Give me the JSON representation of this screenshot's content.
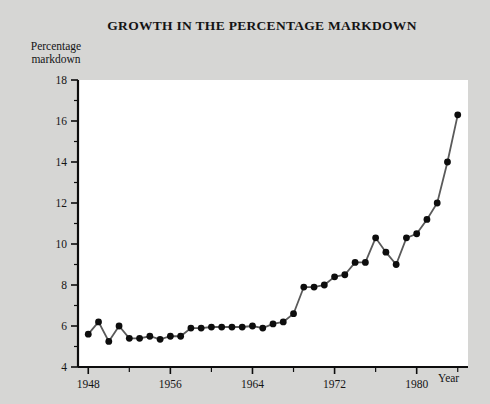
{
  "chart_data": {
    "type": "line",
    "title": "GROWTH IN THE PERCENTAGE MARKDOWN",
    "xlabel": "Year",
    "ylabel": "Percentage markdown",
    "ylabel_line1": "Percentage",
    "ylabel_line2": "markdown",
    "xlim": [
      1947,
      1985
    ],
    "ylim": [
      4,
      18
    ],
    "xticks": [
      1948,
      1952,
      1956,
      1960,
      1964,
      1968,
      1972,
      1976,
      1980,
      1984
    ],
    "xtick_labels": [
      "1948",
      "",
      "1956",
      "",
      "1964",
      "",
      "1972",
      "",
      "1980",
      ""
    ],
    "yticks": [
      4,
      5,
      6,
      7,
      8,
      9,
      10,
      11,
      12,
      13,
      14,
      15,
      16,
      17,
      18
    ],
    "ytick_labels": [
      "4",
      "",
      "6",
      "",
      "8",
      "",
      "10",
      "",
      "12",
      "",
      "14",
      "",
      "16",
      "",
      "18"
    ],
    "grid": false,
    "legend": "none",
    "marker": "filled-circle",
    "line_color": "#5a5a5a",
    "marker_color": "#0d0d0d",
    "axis_color": "#0d0d0d",
    "plot_background": "#ffffff",
    "figure_background": "#d6d6d4",
    "x": [
      1948,
      1949,
      1950,
      1951,
      1952,
      1953,
      1954,
      1955,
      1956,
      1957,
      1958,
      1959,
      1960,
      1961,
      1962,
      1963,
      1964,
      1965,
      1966,
      1967,
      1968,
      1969,
      1970,
      1971,
      1972,
      1973,
      1974,
      1975,
      1976,
      1977,
      1978,
      1979,
      1980,
      1981,
      1982,
      1983,
      1984
    ],
    "values": [
      5.6,
      6.2,
      5.25,
      6.0,
      5.4,
      5.4,
      5.5,
      5.35,
      5.5,
      5.5,
      5.9,
      5.9,
      5.95,
      5.95,
      5.95,
      5.95,
      6.0,
      5.9,
      6.1,
      6.2,
      6.6,
      7.9,
      7.9,
      8.0,
      8.4,
      8.5,
      9.1,
      9.1,
      10.3,
      9.6,
      9.0,
      10.3,
      10.5,
      11.2,
      12.0,
      14.0,
      16.3
    ],
    "series_name": "Percentage markdown"
  }
}
